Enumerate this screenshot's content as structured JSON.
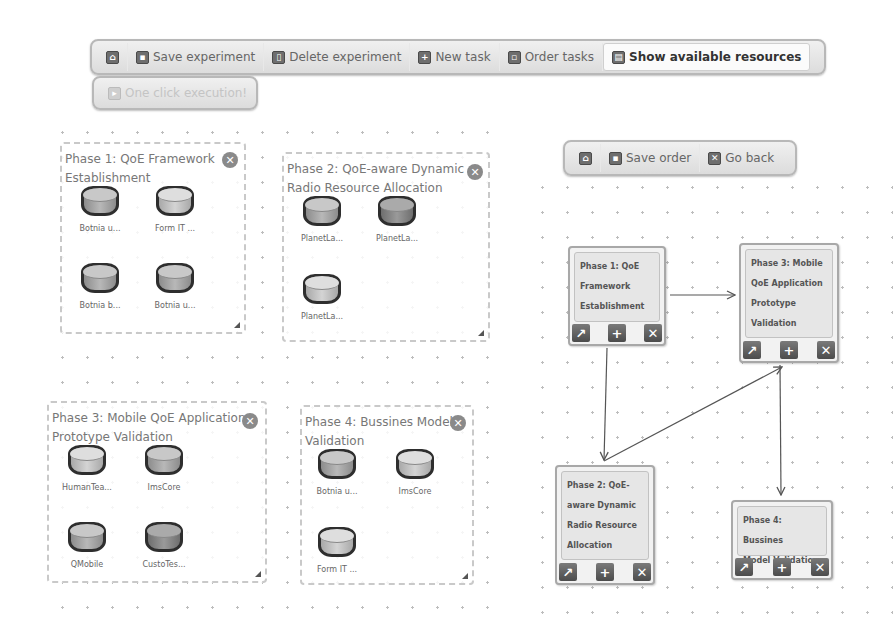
{
  "main_toolbar": {
    "home": {
      "icon": "home-icon"
    },
    "buttons": [
      {
        "label": "Save experiment",
        "icon": "save-icon"
      },
      {
        "label": "Delete experiment",
        "icon": "delete-icon"
      },
      {
        "label": "New task",
        "icon": "plus-icon"
      },
      {
        "label": "Order tasks",
        "icon": "order-icon"
      },
      {
        "label": "Show available resources",
        "icon": "resources-icon",
        "active": true
      }
    ]
  },
  "execution_button": {
    "label": "One click execution!",
    "disabled": true,
    "icon": "play-icon"
  },
  "phases": [
    {
      "title": "Phase 1: QoE Framework Establishment",
      "resources": [
        {
          "label": "Botnia u...",
          "shade": "mid"
        },
        {
          "label": "Form IT ...",
          "shade": "light"
        },
        {
          "label": "Botnia b...",
          "shade": "mid"
        },
        {
          "label": "Botnia u...",
          "shade": "mid"
        }
      ]
    },
    {
      "title": "Phase 2: QoE-aware Dynamic Radio Resource Allocation",
      "resources": [
        {
          "label": "PlanetLa...",
          "shade": "mid"
        },
        {
          "label": "PlanetLa...",
          "shade": "dark"
        },
        {
          "label": "PlanetLa...",
          "shade": "light"
        }
      ]
    },
    {
      "title": "Phase 3: Mobile QoE Application Prototype Validation",
      "resources": [
        {
          "label": "HumanTea...",
          "shade": "light"
        },
        {
          "label": "ImsCore",
          "shade": "mid"
        },
        {
          "label": "QMobile",
          "shade": "mid"
        },
        {
          "label": "CustoTes...",
          "shade": "dark"
        }
      ]
    },
    {
      "title": "Phase 4: Bussines Model Validation",
      "resources": [
        {
          "label": "Botnia u...",
          "shade": "mid"
        },
        {
          "label": "ImsCore",
          "shade": "light"
        },
        {
          "label": "Form IT ...",
          "shade": "light"
        }
      ]
    }
  ],
  "order_toolbar": {
    "home": {
      "icon": "home-icon"
    },
    "buttons": [
      {
        "label": "Save order",
        "icon": "save-icon"
      },
      {
        "label": "Go back",
        "icon": "close-icon"
      }
    ]
  },
  "order_nodes": [
    {
      "lines": [
        "Phase 1: QoE",
        "Framework",
        "Establishment"
      ]
    },
    {
      "lines": [
        "Phase 3: Mobile",
        "QoE Application",
        "Prototype",
        "Validation"
      ]
    },
    {
      "lines": [
        "Phase 2: QoE-",
        "aware Dynamic",
        "Radio Resource",
        "Allocation"
      ]
    },
    {
      "lines": [
        "Phase 4: Bussines",
        "Model Validation"
      ]
    }
  ],
  "node_buttons": {
    "link": "↗",
    "add": "+",
    "remove": "✕"
  },
  "icons": {
    "close": "✕",
    "plus": "+"
  },
  "colors": {
    "background": "#ffffff",
    "toolbar": "#e4e4e4",
    "border": "#b8b8b8",
    "dots": "#bdbdbd"
  }
}
